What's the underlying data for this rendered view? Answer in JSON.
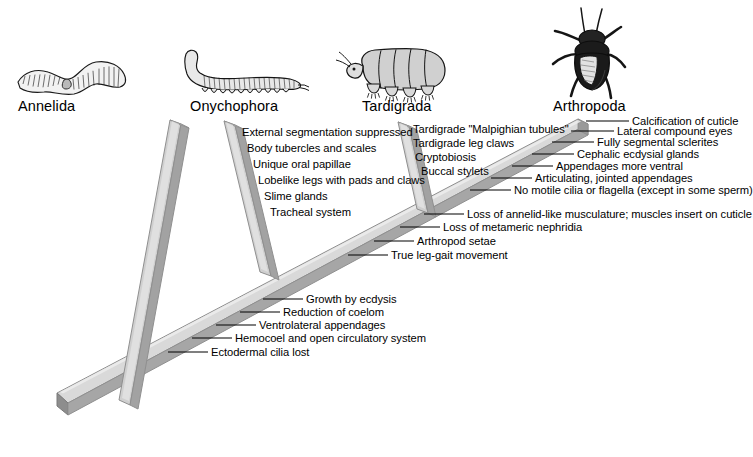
{
  "diagram": {
    "type": "cladogram",
    "colors": {
      "beam_top": "#d9d9d9",
      "beam_face": "#a6a6a6",
      "beam_edge": "#8c8c8c",
      "beam_dark": "#7d7d7d",
      "text": "#000000",
      "background": "#ffffff"
    }
  },
  "taxa": [
    {
      "name": "Annelida",
      "icon": "earthworm-illustration",
      "x": 18,
      "y": 98
    },
    {
      "name": "Onychophora",
      "icon": "velvetworm-illustration",
      "x": 190,
      "y": 98
    },
    {
      "name": "Tardigrada",
      "icon": "waterbear-illustration",
      "x": 362,
      "y": 98
    },
    {
      "name": "Arthropoda",
      "icon": "beetle-illustration",
      "x": 553,
      "y": 98
    }
  ],
  "character_groups": {
    "onychophora": {
      "anchor": "onychophora-branch",
      "align": "left",
      "leader": false,
      "labels": [
        "External segmentation suppressed",
        "Body tubercles and scales",
        "Unique oral papillae",
        "Lobelike legs with pads and claws",
        "Slime glands",
        "Tracheal system"
      ]
    },
    "tardigrada": {
      "anchor": "tardigrada-branch",
      "align": "right",
      "leader": false,
      "labels": [
        "Tardigrade \"Malpighian tubules\"",
        "Tardigrade leg claws",
        "Cryptobiosis",
        "Buccal stylets"
      ]
    },
    "arthropoda": {
      "anchor": "main-diagonal-upper",
      "align": "left",
      "leader": true,
      "labels": [
        "Calcification of cuticle",
        "Lateral compound eyes",
        "Fully segmental sclerites",
        "Cephalic ecdysial glands",
        "Appendages more ventral",
        "Articulating, jointed appendages",
        "No motile cilia or flagella (except in some sperm)"
      ]
    },
    "panarthropoda": {
      "anchor": "main-diagonal-middle",
      "align": "left",
      "leader": true,
      "labels": [
        "Loss of annelid-like musculature; muscles insert on cuticle",
        "Loss of metameric nephridia",
        "Arthropod setae",
        "True leg-gait movement"
      ]
    },
    "ecdysozoa": {
      "anchor": "main-diagonal-lower",
      "align": "left",
      "leader": true,
      "labels": [
        "Growth by ecdysis",
        "Reduction of coelom",
        "Ventrolateral appendages",
        "Hemocoel and open circulatory system",
        "Ectodermal cilia lost"
      ]
    }
  }
}
